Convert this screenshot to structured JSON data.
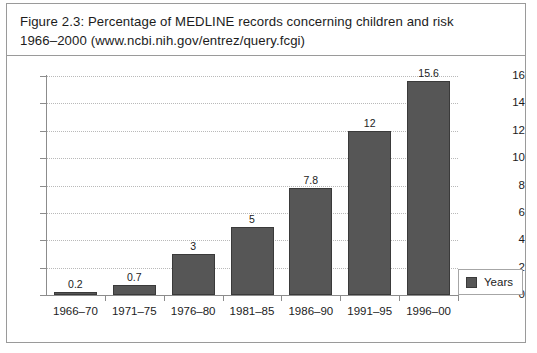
{
  "figure": {
    "caption_line1": "Figure 2.3:  Percentage of MEDLINE records concerning children and risk",
    "caption_line2": "1966–2000 (www.ncbi.nih.gov/entrez/query.fcgi)"
  },
  "legend": {
    "entries": [
      {
        "label": "Years",
        "color": "#565656"
      }
    ]
  },
  "colors": {
    "bar_fill": "#565656",
    "bar_stroke": "#3a3a3a",
    "axis": "#8c8c8c",
    "gridline": "#b9b9b9",
    "frame": "#9a9a9a",
    "text": "#1c1c1c",
    "background": "#ffffff"
  },
  "chart_data": {
    "type": "bar",
    "title": "Figure 2.3:  Percentage of MEDLINE records concerning children and risk 1966–2000 (www.ncbi.nih.gov/entrez/query.fcgi)",
    "xlabel": "",
    "ylabel": "",
    "categories": [
      "1966–70",
      "1971–75",
      "1976–80",
      "1981–85",
      "1986–90",
      "1991–95",
      "1996–00"
    ],
    "values": [
      0.2,
      0.7,
      3,
      5,
      7.8,
      12,
      15.6
    ],
    "value_labels": [
      "0.2",
      "0.7",
      "3",
      "5",
      "7.8",
      "12",
      "15.6"
    ],
    "series": [
      {
        "name": "Years",
        "values": [
          0.2,
          0.7,
          3,
          5,
          7.8,
          12,
          15.6
        ]
      }
    ],
    "ylim": [
      0,
      16
    ],
    "yticks": [
      0,
      2,
      4,
      6,
      8,
      10,
      12,
      14,
      16
    ],
    "ytick_labels": [
      "0",
      "2",
      "4",
      "6",
      "8",
      "10",
      "12",
      "14",
      "16"
    ],
    "grid": true,
    "grid_axis": "y",
    "grid_style": "dotted",
    "legend_position": "right-bottom-outside"
  }
}
